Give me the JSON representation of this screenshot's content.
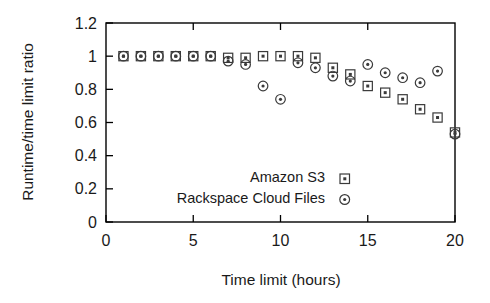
{
  "chart_data": {
    "type": "scatter",
    "title": "",
    "xlabel": "Time limit (hours)",
    "ylabel": "Runtime/time limit ratio",
    "xlim": [
      0,
      20
    ],
    "ylim": [
      0,
      1.2
    ],
    "xticks": [
      0,
      5,
      10,
      15,
      20
    ],
    "xticklabels": [
      "0",
      "5",
      "10",
      "15",
      "20"
    ],
    "yticks": [
      0,
      0.2,
      0.4,
      0.6,
      0.8,
      1,
      1.2
    ],
    "yticklabels": [
      "0",
      "0.2",
      "0.4",
      "0.6",
      "0.8",
      "1",
      "1.2"
    ],
    "grid": false,
    "legend_position": "inside-lower-center",
    "series": [
      {
        "name": "Amazon S3",
        "marker": "square",
        "color": "#3a3a3a",
        "x": [
          1,
          2,
          3,
          4,
          5,
          6,
          7,
          8,
          9,
          10,
          11,
          12,
          13,
          14,
          15,
          16,
          17,
          18,
          19,
          20
        ],
        "y": [
          1.0,
          1.0,
          1.0,
          1.0,
          1.0,
          1.0,
          0.99,
          0.99,
          1.0,
          1.0,
          1.0,
          0.99,
          0.93,
          0.89,
          0.82,
          0.78,
          0.74,
          0.68,
          0.63,
          0.54
        ]
      },
      {
        "name": "Rackspace Cloud Files",
        "marker": "circle",
        "color": "#3a3a3a",
        "x": [
          1,
          2,
          3,
          4,
          5,
          6,
          7,
          8,
          9,
          10,
          11,
          12,
          13,
          14,
          15,
          16,
          17,
          18,
          19,
          20
        ],
        "y": [
          1.0,
          1.0,
          1.0,
          1.0,
          1.0,
          1.0,
          0.97,
          0.95,
          0.82,
          0.74,
          0.96,
          0.93,
          0.88,
          0.85,
          0.95,
          0.9,
          0.87,
          0.84,
          0.91,
          0.53
        ]
      }
    ]
  },
  "legend": {
    "entries": [
      {
        "label": "Amazon S3",
        "marker": "square-marker-icon"
      },
      {
        "label": "Rackspace Cloud Files",
        "marker": "circle-marker-icon"
      }
    ]
  },
  "axes": {
    "x_title": "Time limit (hours)",
    "y_title": "Runtime/time limit ratio"
  }
}
